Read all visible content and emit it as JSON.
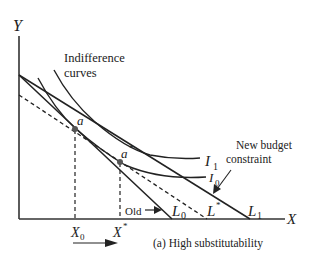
{
  "diagram": {
    "type": "indifference-curve-budget-constraint",
    "caption": "(a) High substitutability",
    "axes": {
      "y_label": "Y",
      "x_label": "X"
    },
    "curve_group_label_line1": "Indifference",
    "curve_group_label_line2": "curves",
    "indifference_curves": [
      {
        "name": "I",
        "sub": "0"
      },
      {
        "name": "I",
        "sub": "1"
      }
    ],
    "budget_lines": [
      {
        "name": "L",
        "sub": "0",
        "style": "solid",
        "annotation": "Old"
      },
      {
        "name": "L",
        "sub": "*",
        "style": "dashed"
      },
      {
        "name": "L",
        "sub": "1",
        "style": "solid"
      }
    ],
    "new_budget_label_line1": "New budget",
    "new_budget_label_line2": "constraint",
    "old_label": "Old",
    "points": [
      {
        "name": "a",
        "sup": ""
      },
      {
        "name": "a",
        "sup": "*"
      }
    ],
    "x_ticks": [
      {
        "name": "X",
        "sub": "0"
      },
      {
        "name": "X",
        "sup": "*"
      }
    ]
  }
}
